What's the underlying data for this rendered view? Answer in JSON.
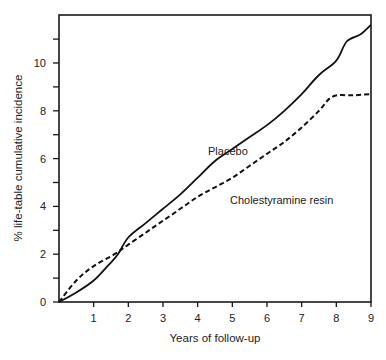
{
  "chart_data": {
    "type": "line",
    "title": "",
    "xlabel": "Years of follow-up",
    "ylabel": "% life-table cumulative incidence",
    "xlim": [
      0,
      9
    ],
    "ylim": [
      0,
      12
    ],
    "x_ticks": [
      1,
      2,
      3,
      4,
      5,
      6,
      7,
      8,
      9
    ],
    "y_ticks_labeled": [
      0,
      2,
      4,
      6,
      8,
      10
    ],
    "y_ticks_minor": [
      1,
      3,
      5,
      7,
      9,
      11
    ],
    "grid": false,
    "legend": "inline annotations",
    "series": [
      {
        "name": "Placebo",
        "style": "solid",
        "points": [
          [
            0,
            0
          ],
          [
            0.5,
            0.4
          ],
          [
            1,
            0.9
          ],
          [
            1.4,
            1.5
          ],
          [
            1.7,
            2.0
          ],
          [
            2,
            2.7
          ],
          [
            2.5,
            3.3
          ],
          [
            3,
            3.9
          ],
          [
            3.5,
            4.5
          ],
          [
            4,
            5.2
          ],
          [
            4.5,
            5.9
          ],
          [
            5,
            6.4
          ],
          [
            5.5,
            6.9
          ],
          [
            6,
            7.4
          ],
          [
            6.5,
            8.0
          ],
          [
            7,
            8.7
          ],
          [
            7.5,
            9.5
          ],
          [
            8,
            10.1
          ],
          [
            8.3,
            10.9
          ],
          [
            8.7,
            11.2
          ],
          [
            9,
            11.6
          ]
        ]
      },
      {
        "name": "Cholestyramine resin",
        "style": "dashed",
        "points": [
          [
            0,
            0
          ],
          [
            0.5,
            0.9
          ],
          [
            1,
            1.5
          ],
          [
            1.6,
            2.0
          ],
          [
            2,
            2.4
          ],
          [
            2.5,
            2.9
          ],
          [
            3,
            3.4
          ],
          [
            3.5,
            3.9
          ],
          [
            4,
            4.4
          ],
          [
            4.5,
            4.8
          ],
          [
            5,
            5.2
          ],
          [
            5.5,
            5.7
          ],
          [
            6,
            6.2
          ],
          [
            6.5,
            6.7
          ],
          [
            7,
            7.3
          ],
          [
            7.5,
            8.0
          ],
          [
            7.9,
            8.6
          ],
          [
            8.5,
            8.65
          ],
          [
            9,
            8.7
          ]
        ]
      }
    ],
    "annotations": [
      {
        "text": "Placebo",
        "x": 4.3,
        "y": 6.6
      },
      {
        "text": "Cholestyramine resin",
        "x": 5.1,
        "y": 4.1
      }
    ]
  },
  "labels": {
    "xlabel": "Years of follow-up",
    "ylabel": "% life-table cumulative incidence",
    "placebo": "Placebo",
    "resin": "Cholestyramine resin"
  }
}
